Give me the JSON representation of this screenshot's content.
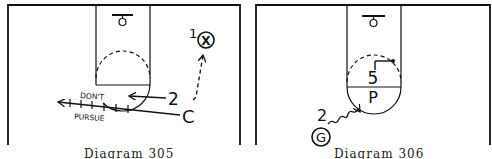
{
  "diagrams": [
    {
      "caption": "Diagram 305",
      "players": {
        "x_label": "1",
        "x_symbol": "X",
        "coach": "C",
        "player_2": "2"
      },
      "annotation": {
        "line1": "DON'T",
        "line2": "PURSUE"
      }
    },
    {
      "caption": "Diagram 306",
      "players": {
        "post_number": "5",
        "post_letter": "P",
        "guard_number": "2",
        "guard_letter": "G"
      }
    }
  ],
  "colors": {
    "ink": "#111111",
    "paper": "#ffffff"
  }
}
